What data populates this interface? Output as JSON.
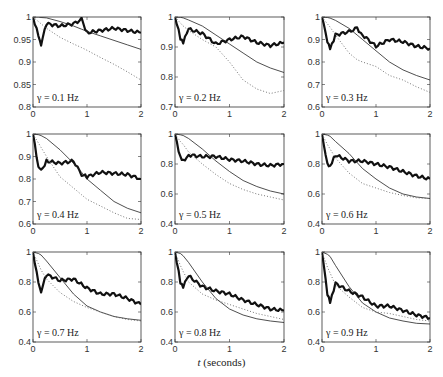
{
  "chart_data": [
    {
      "type": "line",
      "title": "γ = 0.1 Hz",
      "gamma_label": "γ = 0.1 Hz",
      "xlabel": "",
      "ylabel": "",
      "xlim": [
        0,
        2
      ],
      "ylim": [
        0.8,
        1.0
      ],
      "xticks": [
        0,
        1,
        2
      ],
      "yticks": [
        0.8,
        0.85,
        0.9,
        0.95,
        1
      ],
      "x": [
        0,
        0.1,
        0.15,
        0.25,
        0.5,
        0.75,
        0.9,
        1.0,
        1.25,
        1.5,
        1.75,
        2.0
      ],
      "series": [
        {
          "name": "thick (noisy estimate)",
          "style": "thick solid",
          "values": [
            1.0,
            0.96,
            0.94,
            0.985,
            0.98,
            0.985,
            0.995,
            0.965,
            0.97,
            0.975,
            0.97,
            0.965
          ]
        },
        {
          "name": "thin (theory)",
          "style": "thin solid",
          "values": [
            1.0,
            1.0,
            0.999,
            0.998,
            0.99,
            0.98,
            0.973,
            0.968,
            0.958,
            0.948,
            0.938,
            0.928
          ]
        },
        {
          "name": "dotted",
          "style": "dotted",
          "values": [
            1.0,
            0.99,
            0.985,
            0.975,
            0.955,
            0.94,
            0.932,
            0.926,
            0.91,
            0.895,
            0.878,
            0.86
          ]
        }
      ]
    },
    {
      "type": "line",
      "title": "γ = 0.2 Hz",
      "gamma_label": "γ = 0.2 Hz",
      "xlim": [
        0,
        2
      ],
      "ylim": [
        0.7,
        1.0
      ],
      "xticks": [
        0,
        1,
        2
      ],
      "yticks": [
        0.7,
        0.8,
        0.9,
        1
      ],
      "x": [
        0,
        0.1,
        0.15,
        0.25,
        0.5,
        0.75,
        1.0,
        1.25,
        1.5,
        1.75,
        2.0
      ],
      "series": [
        {
          "name": "thick (noisy estimate)",
          "style": "thick solid",
          "values": [
            1.0,
            0.93,
            0.915,
            0.96,
            0.945,
            0.91,
            0.925,
            0.935,
            0.915,
            0.905,
            0.915
          ]
        },
        {
          "name": "thin (theory)",
          "style": "thin solid",
          "values": [
            1.0,
            0.999,
            0.997,
            0.99,
            0.97,
            0.94,
            0.91,
            0.88,
            0.85,
            0.83,
            0.815
          ]
        },
        {
          "name": "dotted",
          "style": "dotted",
          "values": [
            1.0,
            0.98,
            0.97,
            0.955,
            0.925,
            0.9,
            0.85,
            0.79,
            0.76,
            0.745,
            0.755
          ]
        }
      ]
    },
    {
      "type": "line",
      "title": "γ = 0.3 Hz",
      "gamma_label": "γ = 0.3 Hz",
      "xlim": [
        0,
        2
      ],
      "ylim": [
        0.6,
        1.0
      ],
      "xticks": [
        0,
        1,
        2
      ],
      "yticks": [
        0.6,
        0.7,
        0.8,
        0.9,
        1
      ],
      "x": [
        0,
        0.1,
        0.15,
        0.25,
        0.5,
        0.65,
        0.75,
        1.0,
        1.25,
        1.5,
        1.75,
        2.0
      ],
      "series": [
        {
          "name": "thick (noisy estimate)",
          "style": "thick solid",
          "values": [
            1.0,
            0.89,
            0.855,
            0.92,
            0.935,
            0.95,
            0.92,
            0.87,
            0.9,
            0.89,
            0.87,
            0.86
          ]
        },
        {
          "name": "thin (theory)",
          "style": "thin solid",
          "values": [
            1.0,
            0.998,
            0.995,
            0.985,
            0.95,
            0.92,
            0.9,
            0.85,
            0.8,
            0.765,
            0.74,
            0.72
          ]
        },
        {
          "name": "dotted",
          "style": "dotted",
          "values": [
            1.0,
            0.97,
            0.955,
            0.92,
            0.84,
            0.81,
            0.8,
            0.78,
            0.74,
            0.72,
            0.69,
            0.665
          ]
        }
      ]
    },
    {
      "type": "line",
      "title": "γ = 0.4 Hz",
      "gamma_label": "γ = 0.4 Hz",
      "xlim": [
        0,
        2
      ],
      "ylim": [
        0.6,
        1.0
      ],
      "xticks": [
        0,
        1,
        2
      ],
      "yticks": [
        0.6,
        0.7,
        0.8,
        0.9,
        1
      ],
      "x": [
        0,
        0.1,
        0.15,
        0.25,
        0.5,
        0.75,
        0.9,
        1.0,
        1.25,
        1.5,
        1.75,
        2.0
      ],
      "series": [
        {
          "name": "thick (noisy estimate)",
          "style": "thick solid",
          "values": [
            1.0,
            0.85,
            0.835,
            0.88,
            0.87,
            0.88,
            0.82,
            0.81,
            0.83,
            0.825,
            0.82,
            0.8
          ]
        },
        {
          "name": "thin (theory)",
          "style": "thin solid",
          "values": [
            1.0,
            0.997,
            0.993,
            0.98,
            0.93,
            0.87,
            0.83,
            0.8,
            0.75,
            0.7,
            0.67,
            0.65
          ]
        },
        {
          "name": "dotted",
          "style": "dotted",
          "values": [
            1.0,
            0.96,
            0.94,
            0.9,
            0.81,
            0.76,
            0.73,
            0.71,
            0.68,
            0.65,
            0.625,
            0.62
          ]
        }
      ]
    },
    {
      "type": "line",
      "title": "γ = 0.5 Hz",
      "gamma_label": "γ = 0.5 Hz",
      "xlim": [
        0,
        2
      ],
      "ylim": [
        0.4,
        1.0
      ],
      "xticks": [
        0,
        1,
        2
      ],
      "yticks": [
        0.4,
        0.6,
        0.8,
        1
      ],
      "x": [
        0,
        0.1,
        0.15,
        0.25,
        0.5,
        0.75,
        1.0,
        1.25,
        1.5,
        1.75,
        2.0
      ],
      "series": [
        {
          "name": "thick (noisy estimate)",
          "style": "thick solid",
          "values": [
            1.0,
            0.84,
            0.82,
            0.86,
            0.85,
            0.85,
            0.83,
            0.82,
            0.8,
            0.79,
            0.8
          ]
        },
        {
          "name": "thin (theory)",
          "style": "thin solid",
          "values": [
            1.0,
            0.995,
            0.99,
            0.97,
            0.9,
            0.82,
            0.75,
            0.69,
            0.65,
            0.62,
            0.6
          ]
        },
        {
          "name": "dotted",
          "style": "dotted",
          "values": [
            1.0,
            0.95,
            0.93,
            0.88,
            0.8,
            0.73,
            0.67,
            0.63,
            0.6,
            0.58,
            0.56
          ]
        }
      ]
    },
    {
      "type": "line",
      "title": "γ = 0.6 Hz",
      "gamma_label": "γ = 0.6 Hz",
      "xlim": [
        0,
        2
      ],
      "ylim": [
        0.4,
        1.0
      ],
      "xticks": [
        0,
        1,
        2
      ],
      "yticks": [
        0.4,
        0.6,
        0.8,
        1
      ],
      "x": [
        0,
        0.1,
        0.15,
        0.25,
        0.5,
        0.75,
        1.0,
        1.25,
        1.5,
        1.75,
        2.0
      ],
      "series": [
        {
          "name": "thick (noisy estimate)",
          "style": "thick solid",
          "values": [
            1.0,
            0.8,
            0.79,
            0.86,
            0.82,
            0.82,
            0.8,
            0.78,
            0.75,
            0.72,
            0.7
          ]
        },
        {
          "name": "thin (theory)",
          "style": "thin solid",
          "values": [
            1.0,
            0.993,
            0.985,
            0.95,
            0.87,
            0.77,
            0.7,
            0.64,
            0.6,
            0.58,
            0.57
          ]
        },
        {
          "name": "dotted",
          "style": "dotted",
          "values": [
            1.0,
            0.93,
            0.9,
            0.84,
            0.74,
            0.67,
            0.64,
            0.61,
            0.59,
            0.575,
            0.57
          ]
        }
      ]
    },
    {
      "type": "line",
      "title": "γ = 0.7 Hz",
      "gamma_label": "γ = 0.7 Hz",
      "xlim": [
        0,
        2
      ],
      "ylim": [
        0.4,
        1.0
      ],
      "xticks": [
        0,
        1,
        2
      ],
      "yticks": [
        0.4,
        0.6,
        0.8,
        1
      ],
      "x": [
        0,
        0.1,
        0.15,
        0.25,
        0.5,
        0.75,
        1.0,
        1.25,
        1.5,
        1.75,
        2.0
      ],
      "series": [
        {
          "name": "thick (noisy estimate)",
          "style": "thick solid",
          "values": [
            1.0,
            0.8,
            0.74,
            0.85,
            0.81,
            0.82,
            0.76,
            0.72,
            0.72,
            0.69,
            0.65
          ]
        },
        {
          "name": "thin (theory)",
          "style": "thin solid",
          "values": [
            1.0,
            0.99,
            0.98,
            0.94,
            0.83,
            0.72,
            0.64,
            0.6,
            0.57,
            0.555,
            0.545
          ]
        },
        {
          "name": "dotted",
          "style": "dotted",
          "values": [
            1.0,
            0.92,
            0.88,
            0.82,
            0.73,
            0.67,
            0.63,
            0.6,
            0.57,
            0.55,
            0.54
          ]
        }
      ]
    },
    {
      "type": "line",
      "title": "γ = 0.8 Hz",
      "gamma_label": "γ = 0.8 Hz",
      "xlim": [
        0,
        2
      ],
      "ylim": [
        0.4,
        1.0
      ],
      "xticks": [
        0,
        1,
        2
      ],
      "yticks": [
        0.4,
        0.6,
        0.8,
        1
      ],
      "x": [
        0,
        0.1,
        0.15,
        0.25,
        0.5,
        0.75,
        1.0,
        1.25,
        1.5,
        1.75,
        2.0
      ],
      "series": [
        {
          "name": "thick (noisy estimate)",
          "style": "thick solid",
          "values": [
            1.0,
            0.8,
            0.77,
            0.84,
            0.77,
            0.74,
            0.72,
            0.68,
            0.65,
            0.62,
            0.61
          ]
        },
        {
          "name": "thin (theory)",
          "style": "thin solid",
          "values": [
            1.0,
            0.99,
            0.975,
            0.93,
            0.8,
            0.69,
            0.62,
            0.58,
            0.555,
            0.54,
            0.53
          ]
        },
        {
          "name": "dotted",
          "style": "dotted",
          "values": [
            1.0,
            0.91,
            0.87,
            0.8,
            0.72,
            0.68,
            0.65,
            0.62,
            0.59,
            0.57,
            0.55
          ]
        }
      ]
    },
    {
      "type": "line",
      "title": "γ = 0.9 Hz",
      "gamma_label": "γ = 0.9 Hz",
      "xlim": [
        0,
        2
      ],
      "ylim": [
        0.4,
        1.0
      ],
      "xticks": [
        0,
        1,
        2
      ],
      "yticks": [
        0.4,
        0.6,
        0.8,
        1
      ],
      "x": [
        0,
        0.1,
        0.15,
        0.25,
        0.5,
        0.75,
        1.0,
        1.25,
        1.5,
        1.75,
        2.0
      ],
      "series": [
        {
          "name": "thick (noisy estimate)",
          "style": "thick solid",
          "values": [
            1.0,
            0.72,
            0.66,
            0.79,
            0.74,
            0.7,
            0.64,
            0.64,
            0.61,
            0.58,
            0.56
          ]
        },
        {
          "name": "thin (theory)",
          "style": "thin solid",
          "values": [
            1.0,
            0.985,
            0.97,
            0.91,
            0.77,
            0.66,
            0.6,
            0.56,
            0.54,
            0.525,
            0.52
          ]
        },
        {
          "name": "dotted",
          "style": "dotted",
          "values": [
            1.0,
            0.9,
            0.86,
            0.78,
            0.7,
            0.63,
            0.6,
            0.59,
            0.57,
            0.55,
            0.54
          ]
        }
      ]
    }
  ],
  "figure": {
    "xlabel_var": "t",
    "xlabel_unit": " (seconds)"
  }
}
